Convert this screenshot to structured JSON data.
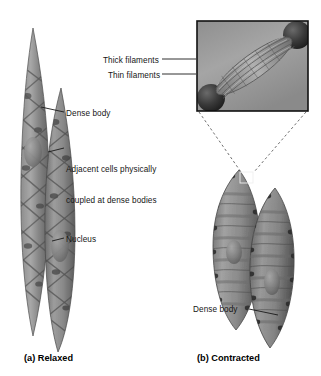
{
  "figure": {
    "type": "smooth-muscle-cell-diagram",
    "background_color": "#ffffff",
    "text_color": "#151515",
    "leader_line_color": "#1a1a1a",
    "dashed_line_color": "#4a4a4a",
    "cell_fill_dark": "#6b6b6b",
    "cell_fill_mid": "#8d8d8d",
    "cell_fill_light": "#b4b4b4",
    "inset_background": "#9a9a9a",
    "inset_border_color": "#111111"
  },
  "labels": {
    "thick_filaments": "Thick filaments",
    "thin_filaments": "Thin filaments",
    "dense_body_relaxed": "Dense body",
    "adjacent_cells_line1": "Adjacent cells physically",
    "adjacent_cells_line2": "coupled at dense bodies",
    "nucleus": "Nucleus",
    "dense_body_contracted": "Dense body"
  },
  "captions": {
    "panel_a": "(a) Relaxed",
    "panel_b": "(b) Contracted"
  },
  "panels": [
    {
      "id": "relaxed",
      "caption": "(a) Relaxed",
      "cell_count": 2,
      "description": "Two elongated overlapping spindle-shaped smooth muscle cells shown relaxed and extended"
    },
    {
      "id": "contracted",
      "caption": "(b) Contracted",
      "cell_count": 2,
      "description": "Two shortened, bulging smooth muscle cells with puckered surfaces shown contracted"
    }
  ],
  "inset": {
    "title": "magnified filament detail",
    "contents": [
      "Thick filaments",
      "Thin filaments",
      "dense bodies"
    ]
  }
}
